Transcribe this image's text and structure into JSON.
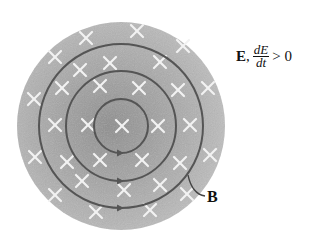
{
  "figure": {
    "type": "electric-field-region-with-induced-magnetic-field",
    "disc": {
      "cx": 121,
      "cy": 126,
      "r": 104,
      "fill": "#a9a9a9",
      "center_fill": "#8f8f8f"
    },
    "rings": [
      {
        "r": 27,
        "arrow_direction": "counterclockwise"
      },
      {
        "r": 55,
        "arrow_direction": "counterclockwise"
      },
      {
        "r": 82,
        "arrow_direction": "counterclockwise"
      }
    ],
    "ring_color": "#555555",
    "field_marker": "×",
    "field_marker_meaning": "into page",
    "field_marker_color": "#f2f2f2",
    "markers": [
      [
        137,
        31
      ],
      [
        86,
        38
      ],
      [
        183,
        46
      ],
      [
        55,
        57
      ],
      [
        110,
        63
      ],
      [
        160,
        62
      ],
      [
        80,
        70
      ],
      [
        208,
        88
      ],
      [
        34,
        99
      ],
      [
        62,
        88
      ],
      [
        100,
        86
      ],
      [
        139,
        88
      ],
      [
        178,
        90
      ],
      [
        122,
        126
      ],
      [
        55,
        125
      ],
      [
        88,
        125
      ],
      [
        158,
        126
      ],
      [
        190,
        125
      ],
      [
        35,
        157
      ],
      [
        67,
        162
      ],
      [
        100,
        160
      ],
      [
        142,
        160
      ],
      [
        180,
        163
      ],
      [
        210,
        155
      ],
      [
        82,
        181
      ],
      [
        124,
        190
      ],
      [
        160,
        185
      ],
      [
        55,
        195
      ],
      [
        96,
        212
      ],
      [
        150,
        210
      ],
      [
        187,
        194
      ]
    ]
  },
  "labels": {
    "e_field": {
      "symbol": "E",
      "separator": ",",
      "frac_num": "dE",
      "frac_den": "dt",
      "relation": "> 0"
    },
    "b_field": {
      "symbol": "B"
    }
  },
  "leader_line": {
    "from": [
      188,
      175
    ],
    "to": [
      205,
      196
    ]
  }
}
